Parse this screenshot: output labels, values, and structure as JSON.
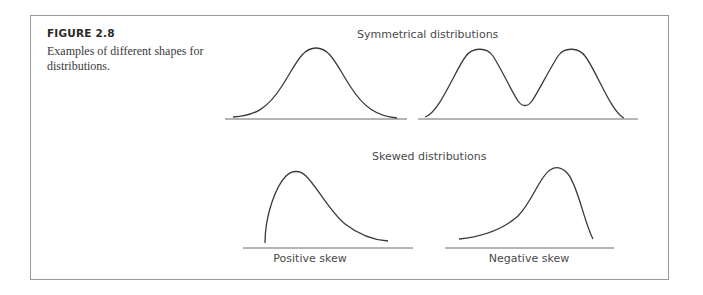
{
  "figure": {
    "label": "FIGURE 2.8",
    "caption": "Examples of different shapes for distributions."
  },
  "sections": {
    "symmetrical": {
      "title": "Symmetrical distributions",
      "panels": [
        {
          "name": "unimodal-normal",
          "label": ""
        },
        {
          "name": "bimodal",
          "label": ""
        }
      ]
    },
    "skewed": {
      "title": "Skewed distributions",
      "panels": [
        {
          "name": "positive-skew",
          "label": "Positive skew"
        },
        {
          "name": "negative-skew",
          "label": "Negative skew"
        }
      ]
    }
  },
  "colors": {
    "border": "#9a9a9a",
    "curve": "#3a3a3a",
    "text": "#4a4a4a"
  }
}
